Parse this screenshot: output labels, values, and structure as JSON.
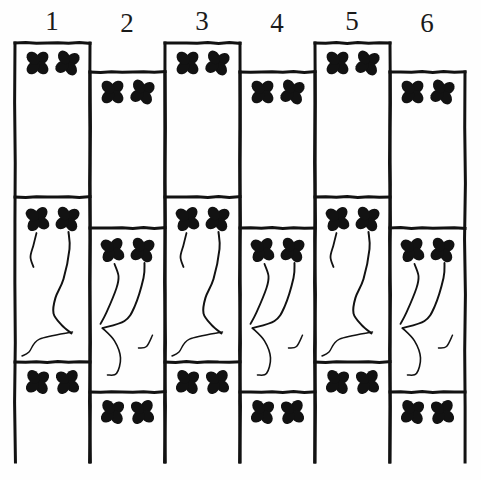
{
  "plate": {
    "title": "Stencil pattern plate — six numbered vertical border strips",
    "background_color": "#ffffff",
    "ink_color": "#121212",
    "width": 481,
    "height": 480,
    "column_count": 6,
    "column_width": 75,
    "first_column_left": 15,
    "motif_name": "four-petal-clover",
    "scroll_motif_name": "vine-scroll"
  },
  "column_labels": [
    {
      "text": "1",
      "x": 52,
      "y": 8
    },
    {
      "text": "2",
      "x": 127,
      "y": 10
    },
    {
      "text": "3",
      "x": 202,
      "y": 8
    },
    {
      "text": "4",
      "x": 277,
      "y": 10
    },
    {
      "text": "5",
      "x": 352,
      "y": 8
    },
    {
      "text": "6",
      "x": 427,
      "y": 10
    }
  ],
  "columns": [
    {
      "number": "1",
      "left": 15,
      "right": 90,
      "top": 43,
      "divider_top": 197,
      "divider_bottom": 362,
      "bottom": 462,
      "parity": "odd",
      "panels": [
        {
          "name": "top-panel",
          "clovers": 2
        },
        {
          "name": "middle-panel",
          "clovers": 2,
          "scroll": "left-leaning-vine"
        },
        {
          "name": "bottom-panel",
          "clovers": 2
        }
      ]
    },
    {
      "number": "2",
      "left": 90,
      "right": 165,
      "top": 72,
      "divider_top": 228,
      "divider_bottom": 392,
      "bottom": 462,
      "parity": "even",
      "panels": [
        {
          "name": "top-panel",
          "clovers": 2
        },
        {
          "name": "middle-panel",
          "clovers": 2,
          "scroll": "right-leaning-vine"
        },
        {
          "name": "bottom-panel",
          "clovers": 2
        }
      ]
    },
    {
      "number": "3",
      "left": 165,
      "right": 240,
      "top": 43,
      "divider_top": 197,
      "divider_bottom": 362,
      "bottom": 462,
      "parity": "odd",
      "panels": [
        {
          "name": "top-panel",
          "clovers": 2
        },
        {
          "name": "middle-panel",
          "clovers": 2,
          "scroll": "left-leaning-vine"
        },
        {
          "name": "bottom-panel",
          "clovers": 2
        }
      ]
    },
    {
      "number": "4",
      "left": 240,
      "right": 315,
      "top": 72,
      "divider_top": 228,
      "divider_bottom": 392,
      "bottom": 462,
      "parity": "even",
      "panels": [
        {
          "name": "top-panel",
          "clovers": 2
        },
        {
          "name": "middle-panel",
          "clovers": 2,
          "scroll": "right-leaning-vine"
        },
        {
          "name": "bottom-panel",
          "clovers": 2
        }
      ]
    },
    {
      "number": "5",
      "left": 315,
      "right": 390,
      "top": 43,
      "divider_top": 197,
      "divider_bottom": 362,
      "bottom": 462,
      "parity": "odd",
      "panels": [
        {
          "name": "top-panel",
          "clovers": 2
        },
        {
          "name": "middle-panel",
          "clovers": 2,
          "scroll": "left-leaning-vine"
        },
        {
          "name": "bottom-panel",
          "clovers": 2
        }
      ]
    },
    {
      "number": "6",
      "left": 390,
      "right": 465,
      "top": 72,
      "divider_top": 228,
      "divider_bottom": 392,
      "bottom": 462,
      "parity": "even",
      "panels": [
        {
          "name": "top-panel",
          "clovers": 2
        },
        {
          "name": "middle-panel",
          "clovers": 2,
          "scroll": "right-leaning-vine"
        },
        {
          "name": "bottom-panel",
          "clovers": 2
        }
      ]
    }
  ]
}
